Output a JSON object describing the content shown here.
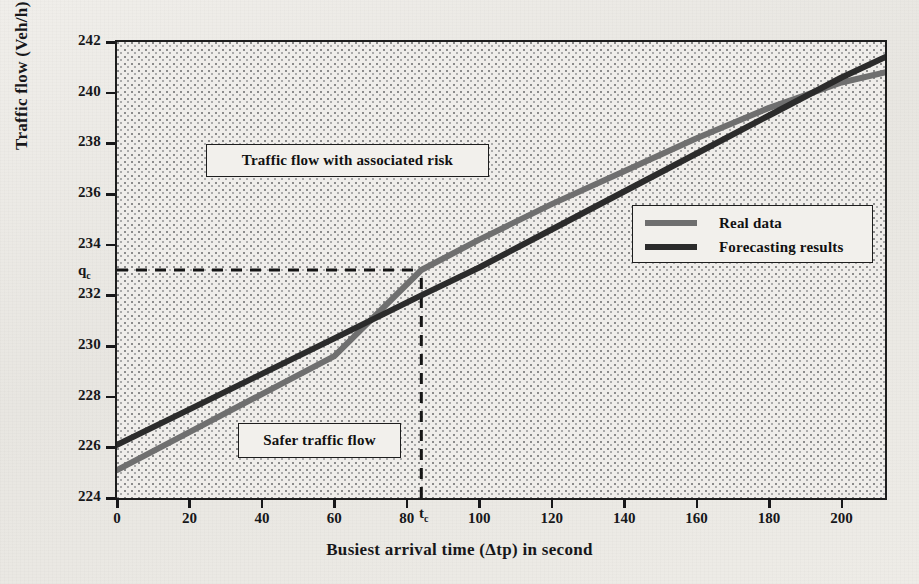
{
  "figure": {
    "background_color": "#eceae6",
    "plot_fill": "#efedea",
    "frame_color": "#1d1d1d"
  },
  "axes": {
    "y_title": "Traffic flow (Veh/h)",
    "x_title": "Busiest arrival time (Δtp) in second",
    "y_ticks": [
      "224",
      "226",
      "228",
      "230",
      "232",
      "234",
      "236",
      "238",
      "240",
      "242"
    ],
    "x_ticks": [
      "0",
      "20",
      "40",
      "60",
      "80",
      "100",
      "120",
      "140",
      "160",
      "180",
      "200"
    ]
  },
  "markers": {
    "qc_label": "q",
    "qc_sub": "c",
    "tc_label": "t",
    "tc_sub": "c",
    "qc_value": 233,
    "tc_value": 84
  },
  "callouts": {
    "risk": "Traffic flow with associated risk",
    "safe": "Safer traffic flow"
  },
  "legend": {
    "position": "right-center",
    "entries": [
      {
        "label": "Real data",
        "color": "#6f6f6f"
      },
      {
        "label": "Forecasting results",
        "color": "#2b2b2b"
      }
    ]
  },
  "chart_data": {
    "type": "line",
    "title": "",
    "xlabel": "Busiest arrival time (Δtp) in second",
    "ylabel": "Traffic flow (Veh/h)",
    "xlim": [
      0,
      212
    ],
    "ylim": [
      224,
      242
    ],
    "xticks": [
      0,
      20,
      40,
      60,
      80,
      100,
      120,
      140,
      160,
      180,
      200
    ],
    "yticks": [
      224,
      226,
      228,
      230,
      232,
      234,
      236,
      238,
      240,
      242
    ],
    "grid": false,
    "legend_position": "right-center",
    "annotations": [
      {
        "text": "Traffic flow with associated risk",
        "x": 50,
        "y": 237.9,
        "type": "box"
      },
      {
        "text": "Safer traffic flow",
        "x": 40,
        "y": 226.8,
        "type": "box"
      },
      {
        "text": "q_c",
        "x": 0,
        "y": 233,
        "type": "axis-marker"
      },
      {
        "text": "t_c",
        "x": 84,
        "y": 224,
        "type": "axis-marker"
      }
    ],
    "reference_lines": [
      {
        "orientation": "horizontal",
        "value": 233,
        "style": "dashed",
        "label": "q_c",
        "from_x": 0,
        "to_x": 84
      },
      {
        "orientation": "vertical",
        "value": 84,
        "style": "dashed",
        "label": "t_c",
        "from_y": 224,
        "to_y": 233
      }
    ],
    "series": [
      {
        "name": "Real data",
        "color": "#6f6f6f",
        "x": [
          0,
          20,
          40,
          60,
          84,
          100,
          120,
          140,
          160,
          180,
          200,
          212
        ],
        "y": [
          225.1,
          226.6,
          228.1,
          229.6,
          233.0,
          234.2,
          235.6,
          236.9,
          238.2,
          239.4,
          240.4,
          240.8
        ]
      },
      {
        "name": "Forecasting results",
        "color": "#2b2b2b",
        "x": [
          0,
          20,
          40,
          60,
          84,
          100,
          120,
          140,
          160,
          180,
          200,
          212
        ],
        "y": [
          226.1,
          227.5,
          228.9,
          230.3,
          232.0,
          233.1,
          234.6,
          236.1,
          237.6,
          239.1,
          240.6,
          241.4
        ]
      }
    ]
  }
}
